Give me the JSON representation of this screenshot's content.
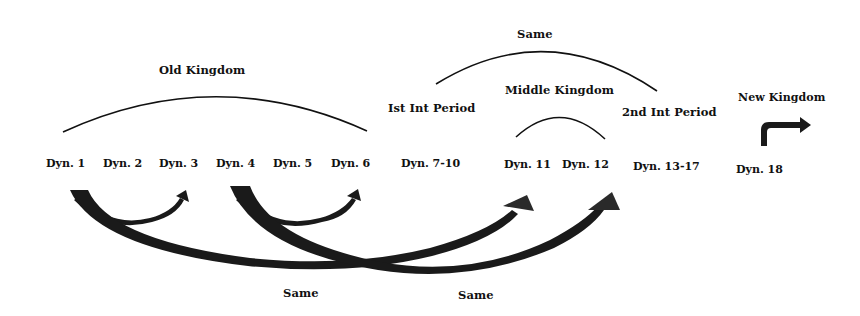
{
  "periods": {
    "old_kingdom": "Old Kingdom",
    "first_int": "Ist Int Period",
    "middle_kingdom": "Middle Kingdom",
    "second_int": "2nd Int Period",
    "new_kingdom": "New Kingdom",
    "same_top": "Same"
  },
  "dynasties": [
    "Dyn. 1",
    "Dyn. 2",
    "Dyn. 3",
    "Dyn. 4",
    "Dyn. 5",
    "Dyn. 6",
    "Dyn. 7-10",
    "Dyn. 11",
    "Dyn. 12",
    "Dyn. 13-17",
    "Dyn. 18"
  ],
  "bottom_labels": {
    "same_left": "Same",
    "same_right": "Same"
  },
  "colors": {
    "ink": "#111111",
    "arrow_fill": "#1a1a1a",
    "background": "#ffffff"
  }
}
